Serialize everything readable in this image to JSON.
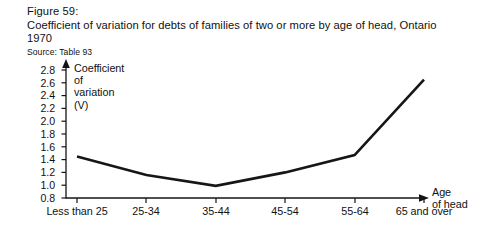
{
  "figure": {
    "number": "Figure 59:",
    "title": "Coefficient of variation for debts of families of two or more by age of head, Ontario 1970",
    "source": "Source: Table 93"
  },
  "chart_data": {
    "type": "line",
    "title": "Coefficient of variation for debts of families of two or more by age of head, Ontario 1970",
    "subtitle": "Figure 59:",
    "source": "Source: Table 93",
    "xlabel": "Age of head",
    "ylabel": "Coefficient of variation (V)",
    "ylabel_lines": [
      "Coefficient",
      "of",
      "variation",
      "(V)"
    ],
    "xlabel_lines": [
      "Age",
      "of head"
    ],
    "categories": [
      "Less than 25",
      "25-34",
      "35-44",
      "45-54",
      "55-64",
      "65 and over"
    ],
    "values": [
      1.45,
      1.16,
      0.99,
      1.2,
      1.47,
      2.65
    ],
    "ylim": [
      0.8,
      2.8
    ],
    "yticks": [
      "0.8",
      "1.0",
      "1.2",
      "1.4",
      "1.6",
      "1.8",
      "2.0",
      "2.2",
      "2.4",
      "2.6",
      "2.8"
    ],
    "ytick_values": [
      0.8,
      1.0,
      1.2,
      1.4,
      1.6,
      1.8,
      2.0,
      2.2,
      2.4,
      2.6,
      2.8
    ],
    "grid": false,
    "legend": "none",
    "line_color": "#161616",
    "axis_color": "#141414",
    "background": "#ffffff"
  }
}
